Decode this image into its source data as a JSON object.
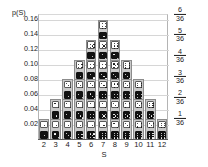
{
  "chart_data": {
    "type": "bar",
    "title": "",
    "xlabel": "S",
    "ylabel": "p(S)",
    "categories": [
      "2",
      "3",
      "4",
      "5",
      "6",
      "7",
      "8",
      "9",
      "10",
      "11",
      "12"
    ],
    "values": [
      0.0278,
      0.0556,
      0.0833,
      0.1111,
      0.1389,
      0.1667,
      0.1389,
      0.1111,
      0.0833,
      0.0556,
      0.0278
    ],
    "counts": [
      1,
      2,
      3,
      4,
      5,
      6,
      5,
      4,
      3,
      2,
      1
    ],
    "ylim": [
      0,
      0.1667
    ],
    "grid": true,
    "legend": "none",
    "y_tick_labels": [
      "0.16",
      "0.14",
      "0.12",
      "0.10",
      "0.08",
      "0.06",
      "0.04",
      "0.02"
    ],
    "y_tick_values": [
      0.16,
      0.14,
      0.12,
      0.1,
      0.08,
      0.06,
      0.04,
      0.02
    ],
    "right_axis_labels": [
      {
        "num": "6",
        "den": "36",
        "value": 0.1667
      },
      {
        "num": "5",
        "den": "36",
        "value": 0.1389
      },
      {
        "num": "4",
        "den": "36",
        "value": 0.1111
      },
      {
        "num": "3",
        "den": "36",
        "value": 0.0833
      },
      {
        "num": "2",
        "den": "36",
        "value": 0.0556
      },
      {
        "num": "1",
        "den": "36",
        "value": 0.0278
      }
    ],
    "bars": [
      {
        "sum": "2",
        "count": 1,
        "pairs": [
          [
            1,
            1
          ]
        ]
      },
      {
        "sum": "3",
        "count": 2,
        "pairs": [
          [
            1,
            2
          ],
          [
            2,
            1
          ]
        ]
      },
      {
        "sum": "4",
        "count": 3,
        "pairs": [
          [
            1,
            3
          ],
          [
            2,
            2
          ],
          [
            3,
            1
          ]
        ]
      },
      {
        "sum": "5",
        "count": 4,
        "pairs": [
          [
            1,
            4
          ],
          [
            2,
            3
          ],
          [
            3,
            2
          ],
          [
            4,
            1
          ]
        ]
      },
      {
        "sum": "6",
        "count": 5,
        "pairs": [
          [
            1,
            5
          ],
          [
            2,
            4
          ],
          [
            3,
            3
          ],
          [
            4,
            2
          ],
          [
            5,
            1
          ]
        ]
      },
      {
        "sum": "7",
        "count": 6,
        "pairs": [
          [
            1,
            6
          ],
          [
            2,
            5
          ],
          [
            3,
            4
          ],
          [
            4,
            3
          ],
          [
            5,
            2
          ],
          [
            6,
            1
          ]
        ]
      },
      {
        "sum": "8",
        "count": 5,
        "pairs": [
          [
            2,
            6
          ],
          [
            3,
            5
          ],
          [
            4,
            4
          ],
          [
            5,
            3
          ],
          [
            6,
            2
          ]
        ]
      },
      {
        "sum": "9",
        "count": 4,
        "pairs": [
          [
            3,
            6
          ],
          [
            4,
            5
          ],
          [
            5,
            4
          ],
          [
            6,
            3
          ]
        ]
      },
      {
        "sum": "10",
        "count": 3,
        "pairs": [
          [
            4,
            6
          ],
          [
            5,
            5
          ],
          [
            6,
            4
          ]
        ]
      },
      {
        "sum": "11",
        "count": 2,
        "pairs": [
          [
            5,
            6
          ],
          [
            6,
            5
          ]
        ]
      },
      {
        "sum": "12",
        "count": 1,
        "pairs": [
          [
            6,
            6
          ]
        ]
      }
    ]
  },
  "colors": {
    "grid": "#d6d6d6",
    "axis": "#5a5a5a",
    "cell_fill": "#c9c9c9",
    "cell_border": "#8c8c8c",
    "die_white": "#ffffff",
    "die_black": "#111111",
    "text": "#1a1a1a"
  }
}
